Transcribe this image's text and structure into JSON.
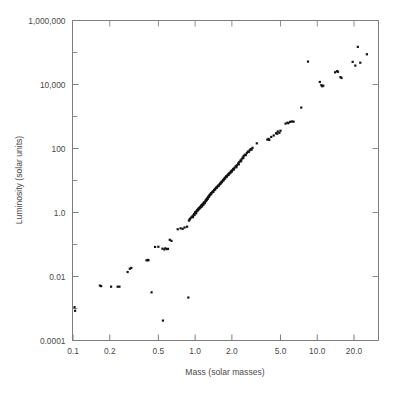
{
  "chart_data": {
    "type": "scatter",
    "title": "",
    "xlabel": "Mass (solar masses)",
    "ylabel": "Luminosity (solar units)",
    "xscale": "log",
    "yscale": "log",
    "xlim": [
      0.09,
      30.0
    ],
    "ylim": [
      0.0001,
      1000000
    ],
    "grid": false,
    "legend": null,
    "xticks": [
      {
        "value": 0.1,
        "label": "0.1"
      },
      {
        "value": 0.2,
        "label": "0.2"
      },
      {
        "value": 0.5,
        "label": "0.5"
      },
      {
        "value": 1.0,
        "label": "1.0"
      },
      {
        "value": 2.0,
        "label": "2.0"
      },
      {
        "value": 5.0,
        "label": "5.0"
      },
      {
        "value": 10.0,
        "label": "10.0"
      },
      {
        "value": 20.0,
        "label": "20.0"
      }
    ],
    "yticks": [
      {
        "value": 1000000,
        "label": "1,000,000"
      },
      {
        "value": 10000,
        "label": "10,000"
      },
      {
        "value": 100,
        "label": "100"
      },
      {
        "value": 1.0,
        "label": "1.0"
      },
      {
        "value": 0.01,
        "label": "0.01"
      },
      {
        "value": 0.0001,
        "label": "0.0001"
      }
    ],
    "yticks_minor": [
      100000,
      1000,
      10,
      0.1,
      0.001
    ],
    "marker": {
      "shape": "square",
      "color": "#121212",
      "size_px": 2.2
    },
    "series": [
      {
        "name": "stars",
        "points": [
          [
            0.103,
            0.0011
          ],
          [
            0.104,
            0.00085
          ],
          [
            0.166,
            0.0052
          ],
          [
            0.17,
            0.005
          ],
          [
            0.205,
            0.0048
          ],
          [
            0.232,
            0.0048
          ],
          [
            0.24,
            0.0048
          ],
          [
            0.28,
            0.0138
          ],
          [
            0.292,
            0.0175
          ],
          [
            0.3,
            0.0185
          ],
          [
            0.4,
            0.032
          ],
          [
            0.41,
            0.033
          ],
          [
            0.415,
            0.032
          ],
          [
            0.44,
            0.0032
          ],
          [
            0.545,
            0.00042
          ],
          [
            0.47,
            0.084
          ],
          [
            0.5,
            0.085
          ],
          [
            0.54,
            0.074
          ],
          [
            0.56,
            0.07
          ],
          [
            0.57,
            0.076
          ],
          [
            0.59,
            0.072
          ],
          [
            0.6,
            0.073
          ],
          [
            0.62,
            0.14
          ],
          [
            0.64,
            0.13
          ],
          [
            0.72,
            0.3
          ],
          [
            0.76,
            0.32
          ],
          [
            0.79,
            0.31
          ],
          [
            0.82,
            0.34
          ],
          [
            0.86,
            0.36
          ],
          [
            0.88,
            0.0022
          ],
          [
            0.89,
            0.56
          ],
          [
            0.9,
            0.6
          ],
          [
            0.91,
            0.64
          ],
          [
            0.93,
            0.7
          ],
          [
            0.95,
            0.76
          ],
          [
            0.96,
            0.72
          ],
          [
            0.97,
            0.82
          ],
          [
            0.98,
            0.9
          ],
          [
            0.99,
            0.85
          ],
          [
            1.0,
            1.0
          ],
          [
            1.01,
            1.05
          ],
          [
            1.02,
            0.95
          ],
          [
            1.03,
            1.1
          ],
          [
            1.04,
            1.2
          ],
          [
            1.05,
            1.15
          ],
          [
            1.06,
            1.3
          ],
          [
            1.07,
            1.25
          ],
          [
            1.08,
            1.4
          ],
          [
            1.09,
            1.35
          ],
          [
            1.1,
            1.5
          ],
          [
            1.11,
            1.45
          ],
          [
            1.12,
            1.6
          ],
          [
            1.13,
            1.7
          ],
          [
            1.14,
            1.55
          ],
          [
            1.15,
            1.8
          ],
          [
            1.16,
            1.9
          ],
          [
            1.17,
            1.75
          ],
          [
            1.18,
            2.0
          ],
          [
            1.19,
            2.1
          ],
          [
            1.2,
            1.95
          ],
          [
            1.21,
            2.2
          ],
          [
            1.22,
            2.4
          ],
          [
            1.23,
            2.3
          ],
          [
            1.24,
            2.6
          ],
          [
            1.25,
            2.5
          ],
          [
            1.26,
            2.8
          ],
          [
            1.27,
            2.7
          ],
          [
            1.28,
            3.0
          ],
          [
            1.29,
            3.2
          ],
          [
            1.3,
            3.1
          ],
          [
            1.31,
            3.4
          ],
          [
            1.32,
            3.6
          ],
          [
            1.33,
            3.5
          ],
          [
            1.34,
            3.8
          ],
          [
            1.35,
            4.0
          ],
          [
            1.36,
            3.9
          ],
          [
            1.38,
            4.3
          ],
          [
            1.4,
            4.6
          ],
          [
            1.41,
            4.4
          ],
          [
            1.43,
            5.0
          ],
          [
            1.45,
            5.4
          ],
          [
            1.46,
            5.2
          ],
          [
            1.48,
            5.8
          ],
          [
            1.5,
            6.2
          ],
          [
            1.51,
            6.0
          ],
          [
            1.53,
            6.6
          ],
          [
            1.55,
            7.0
          ],
          [
            1.56,
            6.8
          ],
          [
            1.58,
            7.5
          ],
          [
            1.6,
            8.0
          ],
          [
            1.61,
            7.8
          ],
          [
            1.63,
            8.6
          ],
          [
            1.65,
            9.2
          ],
          [
            1.66,
            8.9
          ],
          [
            1.68,
            9.8
          ],
          [
            1.7,
            10.5
          ],
          [
            1.71,
            10.1
          ],
          [
            1.73,
            11.2
          ],
          [
            1.75,
            12.0
          ],
          [
            1.76,
            11.6
          ],
          [
            1.78,
            12.8
          ],
          [
            1.8,
            13.6
          ],
          [
            1.82,
            13.2
          ],
          [
            1.84,
            14.5
          ],
          [
            1.86,
            15.5
          ],
          [
            1.88,
            15.0
          ],
          [
            1.9,
            16.5
          ],
          [
            1.92,
            17.5
          ],
          [
            1.94,
            17.0
          ],
          [
            1.96,
            18.5
          ],
          [
            1.98,
            20.0
          ],
          [
            2.0,
            19.0
          ],
          [
            2.02,
            21.0
          ],
          [
            2.05,
            23.0
          ],
          [
            2.08,
            22.0
          ],
          [
            2.1,
            25.0
          ],
          [
            2.15,
            28.0
          ],
          [
            2.18,
            26.0
          ],
          [
            2.2,
            30.0
          ],
          [
            2.25,
            34.0
          ],
          [
            2.28,
            32.0
          ],
          [
            2.3,
            38.0
          ],
          [
            2.35,
            42.0
          ],
          [
            2.38,
            40.0
          ],
          [
            2.4,
            46.0
          ],
          [
            2.45,
            52.0
          ],
          [
            2.48,
            50.0
          ],
          [
            2.5,
            58.0
          ],
          [
            2.55,
            64.0
          ],
          [
            2.6,
            62.0
          ],
          [
            2.65,
            72.0
          ],
          [
            2.7,
            80.0
          ],
          [
            2.75,
            78.0
          ],
          [
            2.8,
            88.0
          ],
          [
            2.85,
            96.0
          ],
          [
            2.9,
            92.0
          ],
          [
            2.95,
            105.0
          ],
          [
            3.2,
            145.0
          ],
          [
            3.9,
            190.0
          ],
          [
            4.0,
            200.0
          ],
          [
            4.05,
            185.0
          ],
          [
            4.2,
            230.0
          ],
          [
            4.4,
            255.0
          ],
          [
            4.6,
            300.0
          ],
          [
            4.7,
            290.0
          ],
          [
            4.75,
            340.0
          ],
          [
            4.9,
            310.0
          ],
          [
            5.0,
            360.0
          ],
          [
            5.5,
            600.0
          ],
          [
            5.7,
            640.0
          ],
          [
            5.8,
            620.0
          ],
          [
            6.0,
            680.0
          ],
          [
            6.2,
            700.0
          ],
          [
            6.4,
            690.0
          ],
          [
            7.4,
            1900.0
          ],
          [
            8.4,
            52000.0
          ],
          [
            10.5,
            12000.0
          ],
          [
            10.8,
            9500.0
          ],
          [
            11.0,
            8800.0
          ],
          [
            11.2,
            9200.0
          ],
          [
            14.0,
            24000.0
          ],
          [
            14.5,
            26000.0
          ],
          [
            14.8,
            25000.0
          ],
          [
            15.5,
            17000.0
          ],
          [
            15.8,
            16000.0
          ],
          [
            19.5,
            51000.0
          ],
          [
            20.5,
            39000.0
          ],
          [
            21.5,
            150000.0
          ],
          [
            22.5,
            48000.0
          ],
          [
            25.5,
            88000.0
          ]
        ]
      }
    ]
  },
  "axes": {
    "x_title": "Mass (solar masses)",
    "y_title": "Luminosity (solar units)"
  }
}
